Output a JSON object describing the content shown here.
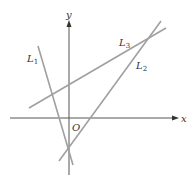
{
  "diagram": {
    "axes": {
      "x_label": "x",
      "y_label": "y",
      "origin_label": "O",
      "color": "#555555"
    },
    "lines": [
      {
        "name": "L1",
        "label_main": "L",
        "label_sub": "1",
        "color": "#a0a0a0"
      },
      {
        "name": "L2",
        "label_main": "L",
        "label_sub": "2",
        "color": "#a0a0a0"
      },
      {
        "name": "L3",
        "label_main": "L",
        "label_sub": "3",
        "color": "#a0a0a0"
      }
    ]
  }
}
